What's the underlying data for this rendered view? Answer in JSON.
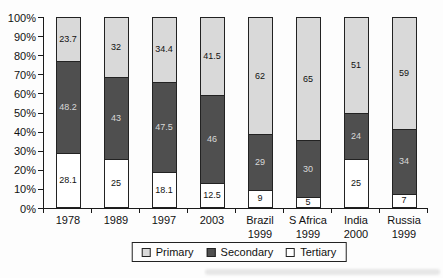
{
  "chart_data": {
    "type": "bar",
    "subtype": "stacked-100-percent-column",
    "title": "",
    "xlabel": "",
    "ylabel": "",
    "grid": false,
    "categories": [
      [
        "1978"
      ],
      [
        "1989"
      ],
      [
        "1997"
      ],
      [
        "2003"
      ],
      [
        "Brazil",
        "1999"
      ],
      [
        "S Africa",
        "1999"
      ],
      [
        "India",
        "2000"
      ],
      [
        "Russia",
        "1999"
      ]
    ],
    "series": [
      {
        "name": "Primary",
        "color": "#d9d9d9",
        "label_color": "#111111",
        "values": [
          23.7,
          32,
          34.4,
          41.5,
          62,
          65,
          51,
          59
        ]
      },
      {
        "name": "Secondary",
        "color": "#4f4f4f",
        "label_color": "#d8d8d8",
        "values": [
          48.2,
          43,
          47.5,
          46,
          29,
          30,
          24,
          34
        ]
      },
      {
        "name": "Tertiary",
        "color": "#ffffff",
        "label_color": "#111111",
        "values": [
          28.1,
          25,
          18.1,
          12.5,
          9,
          5,
          25,
          7
        ]
      }
    ],
    "stack_order_bottom_to_top": [
      "Tertiary",
      "Secondary",
      "Primary"
    ],
    "y_axis": {
      "min": 0,
      "max": 100,
      "tick_labels": [
        "0%",
        "10%",
        "20%",
        "30%",
        "40%",
        "50%",
        "60%",
        "70%",
        "80%",
        "90%",
        "100%"
      ]
    },
    "legend": {
      "position": "bottom",
      "entries": [
        "Primary",
        "Secondary",
        "Tertiary"
      ]
    }
  }
}
